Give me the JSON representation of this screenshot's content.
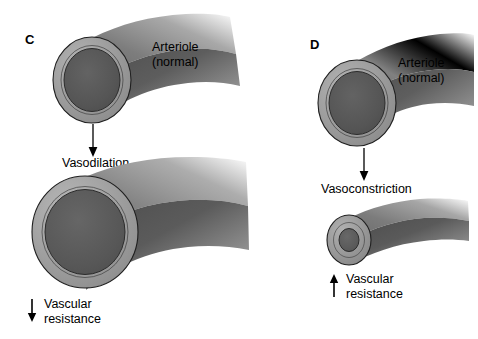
{
  "figure": {
    "background": "#ffffff",
    "colors": {
      "outline": "#1a1a1a",
      "wall_light": "#9d9d9d",
      "wall_mid": "#8a8a8a",
      "lumen_dark": "#555555",
      "lumen_mid": "#5f5f5f",
      "tube_dark": "#4a4a4a",
      "text": "#000000"
    }
  },
  "panels": [
    {
      "id": "C",
      "letter": "C",
      "top_vessel_label_line1": "Arteriole",
      "top_vessel_label_line2": "(normal)",
      "process_label": "Vasodilation",
      "process_arrow": "down-arrow-icon",
      "result_arrow_direction": "down",
      "result_arrow_icon": "down-arrow-icon",
      "result_label_line1": "Vascular",
      "result_label_line2": "resistance",
      "top_vessel_state": "normal",
      "bottom_vessel_state": "dilated"
    },
    {
      "id": "D",
      "letter": "D",
      "top_vessel_label_line1": "Arteriole",
      "top_vessel_label_line2": "(normal)",
      "process_label": "Vasoconstriction",
      "process_arrow": "down-arrow-icon",
      "result_arrow_direction": "up",
      "result_arrow_icon": "up-arrow-icon",
      "result_label_line1": "Vascular",
      "result_label_line2": "resistance",
      "top_vessel_state": "normal",
      "bottom_vessel_state": "constricted"
    }
  ]
}
